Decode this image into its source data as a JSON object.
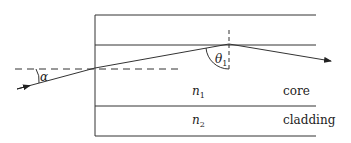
{
  "diagram": {
    "labels": {
      "alpha": "α",
      "theta": "θ",
      "theta_sub": "1",
      "n1": "n",
      "n1_sub": "1",
      "n2": "n",
      "n2_sub": "2",
      "core": "core",
      "cladding": "cladding"
    },
    "regions": [
      "cladding (top)",
      "core",
      "cladding (bottom)"
    ],
    "colors": {
      "stroke": "#333333",
      "background": "#ffffff"
    }
  }
}
